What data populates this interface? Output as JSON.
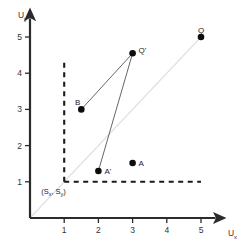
{
  "chart_data": {
    "type": "scatter",
    "title": "",
    "xlabel": "U",
    "xlabel_sub": "x",
    "ylabel": "U",
    "ylabel_sub": "y",
    "xlim": [
      0,
      5.6
    ],
    "ylim": [
      0,
      5.4
    ],
    "xticks": [
      "1",
      "2",
      "3",
      "4",
      "5"
    ],
    "xtick_values": [
      1,
      2,
      3,
      4,
      5
    ],
    "yticks": [
      "1",
      "2",
      "3",
      "4",
      "5"
    ],
    "ytick_values": [
      1,
      2,
      3,
      4,
      5
    ],
    "grid": false,
    "legend": "none",
    "points": [
      {
        "label": "Q",
        "x": 5.0,
        "y": 5.0,
        "label_dx": 0,
        "label_dy": -7
      },
      {
        "label": "Q'",
        "x": 3.0,
        "y": 4.55,
        "label_dx": 6,
        "label_dy": -3
      },
      {
        "label": "B",
        "x": 1.5,
        "y": 3.0,
        "label_dx": -1,
        "label_dy": -7
      },
      {
        "label": "A'",
        "x": 2.0,
        "y": 1.3,
        "label_dx": 6,
        "label_dy": 0
      },
      {
        "label": "A",
        "x": 3.0,
        "y": 1.52,
        "label_dx": 6,
        "label_dy": 0
      }
    ],
    "connectors": [
      {
        "from": "B",
        "to": "Q'"
      },
      {
        "from": "A'",
        "to": "Q'"
      }
    ],
    "identity_line": {
      "from": [
        0,
        0
      ],
      "to": [
        5.0,
        5.0
      ],
      "color": "#e2e2e2"
    },
    "dashed_lines": [
      {
        "orientation": "vertical",
        "at": 1.0,
        "from": 1.0,
        "to": 4.35
      },
      {
        "orientation": "horizontal",
        "at": 1.0,
        "from": 1.0,
        "to": 5.0
      }
    ],
    "annotations": [
      {
        "text": "(S",
        "sub1": "x",
        "mid": ", S",
        "sub2": "y",
        "end": ")",
        "x": 1.0,
        "y": 1.0
      }
    ],
    "annotation_full_text": "(Sx, Sy)",
    "colors": {
      "axis": "#2b2b2b",
      "point": "#0d0d0d",
      "connector": "#555555",
      "dashed": "#1a1a1a",
      "identity": "#e2e2e2",
      "background": "#ffffff"
    }
  }
}
